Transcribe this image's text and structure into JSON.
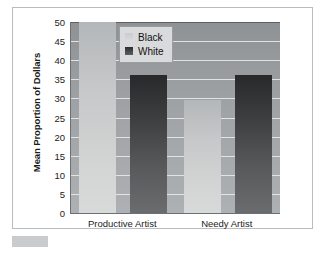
{
  "figure": {
    "frame_color": "#b9bcc0",
    "plot_background": "#a0a3a6",
    "caption_swatch_color": "#c9cbcc"
  },
  "chart_data": {
    "type": "bar",
    "title": "",
    "xlabel": "",
    "ylabel": "Mean Proportion of Dollars",
    "categories": [
      "Productive Artist",
      "Needy Artist"
    ],
    "series": [
      {
        "name": "Black",
        "color": "#d0d2d3",
        "values": [
          50,
          29.5
        ]
      },
      {
        "name": "White",
        "color": "#3b3d3f",
        "values": [
          36,
          36
        ]
      }
    ],
    "ylim": [
      0,
      50
    ],
    "yticks": [
      0,
      5,
      10,
      15,
      20,
      25,
      30,
      35,
      40,
      45,
      50
    ],
    "ytick_labels": [
      "0",
      "5",
      "10",
      "15",
      "20",
      "25",
      "30",
      "35",
      "40",
      "45",
      "50"
    ],
    "grid": true,
    "gridline_color": "#e6e8e9",
    "legend": {
      "position": "top-center",
      "entries": [
        {
          "label": "Black",
          "swatch": "light"
        },
        {
          "label": "White",
          "swatch": "dark"
        }
      ]
    }
  }
}
